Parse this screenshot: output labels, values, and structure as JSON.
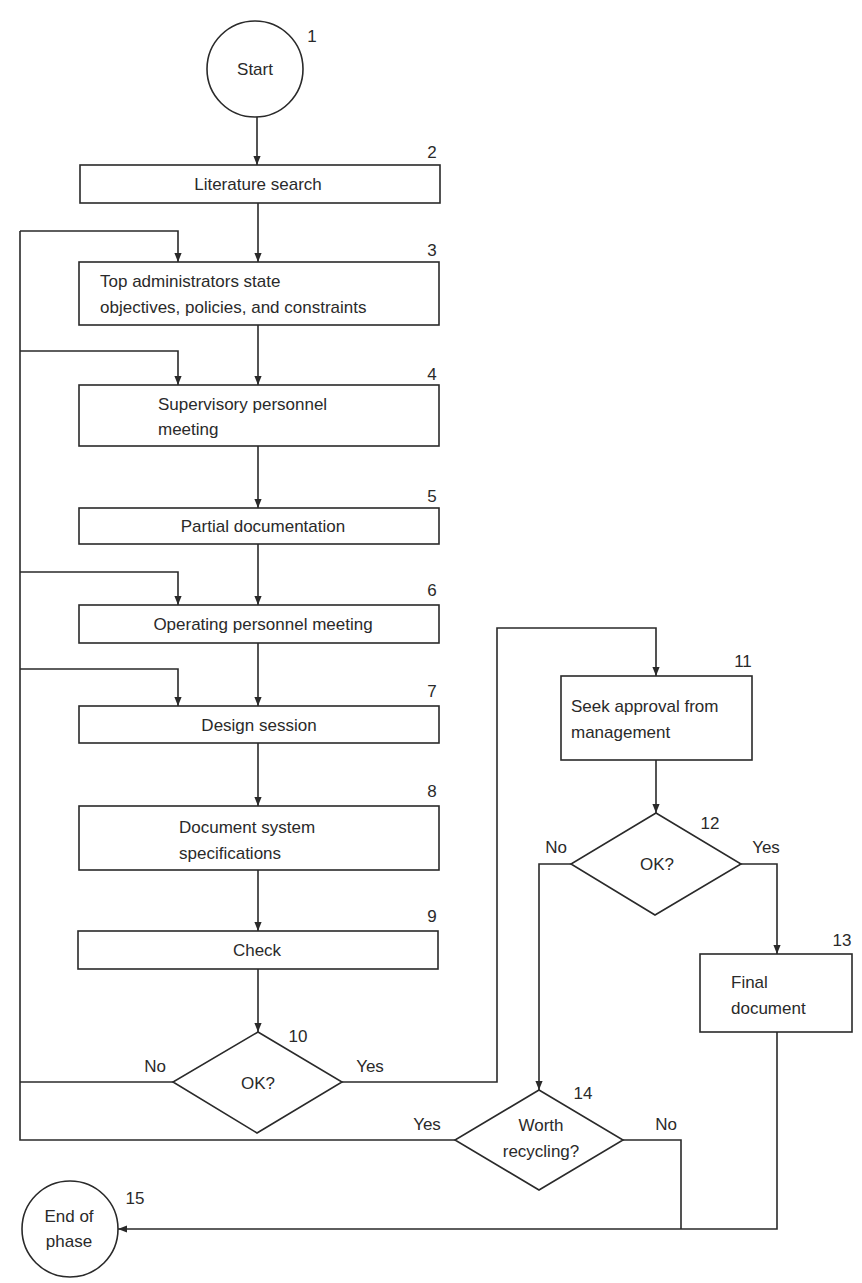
{
  "diagram": {
    "type": "flowchart",
    "nodes": [
      {
        "id": 1,
        "number": "1",
        "shape": "circle",
        "lines": [
          "Start"
        ]
      },
      {
        "id": 2,
        "number": "2",
        "shape": "process",
        "lines": [
          "Literature search"
        ]
      },
      {
        "id": 3,
        "number": "3",
        "shape": "process",
        "lines": [
          "Top administrators state",
          "objectives, policies, and constraints"
        ]
      },
      {
        "id": 4,
        "number": "4",
        "shape": "process",
        "lines": [
          "Supervisory personnel",
          "meeting"
        ]
      },
      {
        "id": 5,
        "number": "5",
        "shape": "process",
        "lines": [
          "Partial documentation"
        ]
      },
      {
        "id": 6,
        "number": "6",
        "shape": "process",
        "lines": [
          "Operating personnel meeting"
        ]
      },
      {
        "id": 7,
        "number": "7",
        "shape": "process",
        "lines": [
          "Design session"
        ]
      },
      {
        "id": 8,
        "number": "8",
        "shape": "process",
        "lines": [
          "Document system",
          "specifications"
        ]
      },
      {
        "id": 9,
        "number": "9",
        "shape": "process",
        "lines": [
          "Check"
        ]
      },
      {
        "id": 10,
        "number": "10",
        "shape": "decision",
        "lines": [
          "OK?"
        ]
      },
      {
        "id": 11,
        "number": "11",
        "shape": "process",
        "lines": [
          "Seek approval from",
          "management"
        ]
      },
      {
        "id": 12,
        "number": "12",
        "shape": "decision",
        "lines": [
          "OK?"
        ]
      },
      {
        "id": 13,
        "number": "13",
        "shape": "process",
        "lines": [
          "Final",
          "document"
        ]
      },
      {
        "id": 14,
        "number": "14",
        "shape": "decision",
        "lines": [
          "Worth",
          "recycling?"
        ]
      },
      {
        "id": 15,
        "number": "15",
        "shape": "circle",
        "lines": [
          "End of",
          "phase"
        ]
      }
    ],
    "edges": [
      {
        "from": 1,
        "to": 2
      },
      {
        "from": 2,
        "to": 3
      },
      {
        "from": 3,
        "to": 4
      },
      {
        "from": 4,
        "to": 5
      },
      {
        "from": 5,
        "to": 6
      },
      {
        "from": 6,
        "to": 7
      },
      {
        "from": 7,
        "to": 8
      },
      {
        "from": 8,
        "to": 9
      },
      {
        "from": 9,
        "to": 10
      },
      {
        "from": 10,
        "to": 11,
        "label": "Yes"
      },
      {
        "from": 10,
        "to": [
          3,
          4,
          6,
          7
        ],
        "label": "No"
      },
      {
        "from": 11,
        "to": 12
      },
      {
        "from": 12,
        "to": 13,
        "label": "Yes"
      },
      {
        "from": 12,
        "to": 14,
        "label": "No"
      },
      {
        "from": 14,
        "to": [
          3,
          4,
          6,
          7
        ],
        "label": "Yes"
      },
      {
        "from": 14,
        "to": 15,
        "label": "No"
      },
      {
        "from": 13,
        "to": 15
      }
    ],
    "branch_labels": {
      "d10_no": "No",
      "d10_yes": "Yes",
      "d12_no": "No",
      "d12_yes": "Yes",
      "d14_yes": "Yes",
      "d14_no": "No"
    },
    "colors": {
      "stroke": "#2a2a2a",
      "background": "#ffffff"
    }
  }
}
